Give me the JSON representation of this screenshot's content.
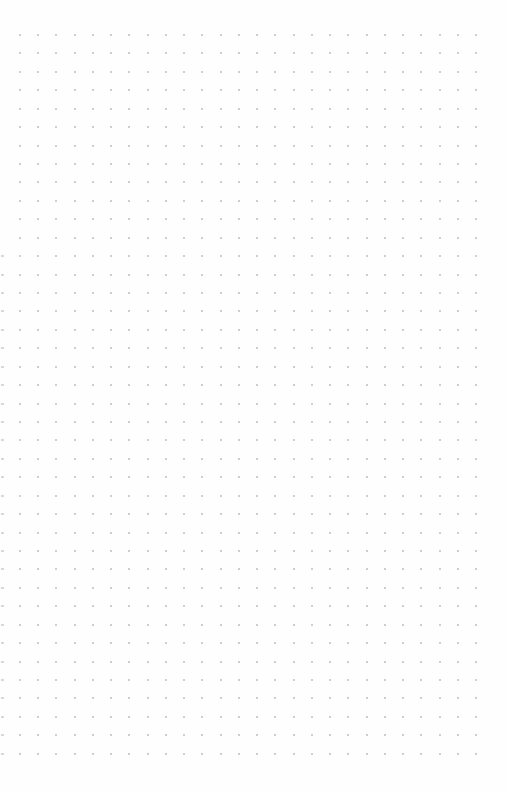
{
  "page": {
    "type": "dot-grid-notebook-page",
    "background": "#fefefe",
    "dot_color": "#bdbdbd",
    "edge_mark_color": "#d8d8d8"
  },
  "grid": {
    "columns": 26,
    "rows": 40,
    "origin_x": 20,
    "origin_y": 35,
    "spacing_x": 18.24,
    "spacing_y": 18.43
  }
}
